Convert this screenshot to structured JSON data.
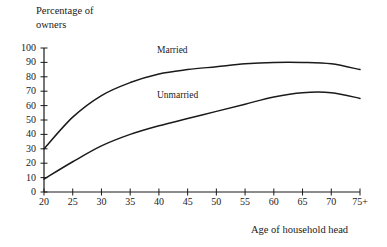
{
  "axes": {
    "y_title": "Percentage of\nowners",
    "x_title": "Age of household head",
    "y_ticks": [
      "0",
      "10",
      "20",
      "30",
      "40",
      "50",
      "60",
      "70",
      "80",
      "90",
      "100"
    ],
    "x_ticks": [
      "20",
      "25",
      "30",
      "35",
      "40",
      "45",
      "50",
      "55",
      "60",
      "65",
      "70",
      "75+"
    ]
  },
  "series_labels": {
    "married": "Married",
    "unmarried": "Unmarried"
  },
  "style": {
    "line_color": "#1a1a1a",
    "axis_color": "#1a1a1a",
    "background": "#ffffff"
  },
  "chart_data": {
    "type": "line",
    "title": "",
    "xlabel": "Age of household head",
    "ylabel": "Percentage of owners",
    "x": [
      20,
      25,
      30,
      35,
      40,
      45,
      50,
      55,
      60,
      65,
      70,
      75
    ],
    "xtick_labels": [
      "20",
      "25",
      "30",
      "35",
      "40",
      "45",
      "50",
      "55",
      "60",
      "65",
      "70",
      "75+"
    ],
    "xlim": [
      20,
      75
    ],
    "ylim": [
      0,
      100
    ],
    "ytick_step": 10,
    "grid": false,
    "legend": "inline-labels",
    "series": [
      {
        "name": "Married",
        "values": [
          30,
          52,
          67,
          76,
          82,
          85,
          87,
          89,
          90,
          90,
          89,
          85
        ]
      },
      {
        "name": "Unmarried",
        "values": [
          9,
          21,
          32,
          40,
          46,
          51,
          56,
          61,
          66,
          69,
          69,
          65
        ]
      }
    ]
  }
}
